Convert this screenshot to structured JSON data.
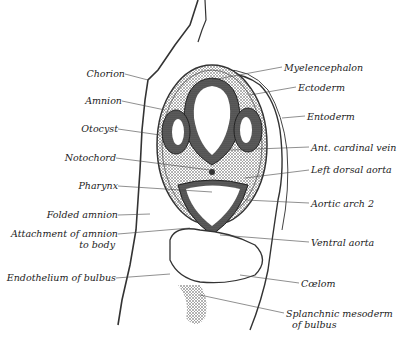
{
  "figure": {
    "type": "embryo cross-section illustration",
    "labels_left": [
      {
        "id": "chorion",
        "text": "Chorion"
      },
      {
        "id": "amnion",
        "text": "Amnion"
      },
      {
        "id": "otocyst",
        "text": "Otocyst"
      },
      {
        "id": "notochord",
        "text": "Notochord"
      },
      {
        "id": "pharynx",
        "text": "Pharynx"
      },
      {
        "id": "folded_amnion",
        "text": "Folded amnion"
      },
      {
        "id": "attachment_1",
        "text": "Attachment of amnion"
      },
      {
        "id": "attachment_2",
        "text": "to body"
      },
      {
        "id": "endothelium",
        "text": "Endothelium of bulbus"
      }
    ],
    "labels_right": [
      {
        "id": "myelencephalon",
        "text": "Myelencephalon"
      },
      {
        "id": "ectoderm",
        "text": "Ectoderm"
      },
      {
        "id": "entoderm",
        "text": "Entoderm"
      },
      {
        "id": "ant_cardinal_vein",
        "text": "Ant. cardinal vein"
      },
      {
        "id": "left_dorsal_aorta",
        "text": "Left dorsal aorta"
      },
      {
        "id": "aortic_arch",
        "text": "Aortic arch 2"
      },
      {
        "id": "ventral_aorta",
        "text": "Ventral aorta"
      },
      {
        "id": "coelom",
        "text": "Cœlom"
      },
      {
        "id": "splanchnic_1",
        "text": "Splanchnic mesoderm"
      },
      {
        "id": "splanchnic_2",
        "text": "of bulbus"
      }
    ]
  }
}
